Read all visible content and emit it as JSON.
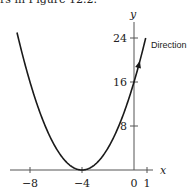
{
  "caption": {
    "text": "rs in Figure 12.2."
  },
  "chart_data": {
    "type": "line",
    "title": "",
    "xlabel": "x",
    "ylabel": "y",
    "function": "y = (x + 4)^2",
    "x_ticks": [
      -8,
      -4,
      0,
      1
    ],
    "x_tick_labels": [
      "−8",
      "−4",
      "0",
      "1"
    ],
    "y_ticks": [
      8,
      16,
      24
    ],
    "y_tick_labels": [
      "8",
      "16",
      "24"
    ],
    "xlim": [
      -9.5,
      1.5
    ],
    "ylim": [
      0,
      27
    ],
    "grid": false,
    "series": [
      {
        "name": "parabola",
        "x": [
          -9,
          -8,
          -7,
          -6,
          -5,
          -4,
          -3,
          -2,
          -1,
          0,
          0.9
        ],
        "y": [
          25,
          16,
          9,
          4,
          1,
          0,
          1,
          4,
          9,
          16,
          24
        ]
      }
    ],
    "annotations": [
      {
        "text": "Direction",
        "x": 0.5,
        "y": 20.5,
        "arrow": "up along curve"
      }
    ]
  },
  "colors": {
    "curve": "#1a1a1a",
    "axis": "#555555",
    "text": "#222222"
  }
}
